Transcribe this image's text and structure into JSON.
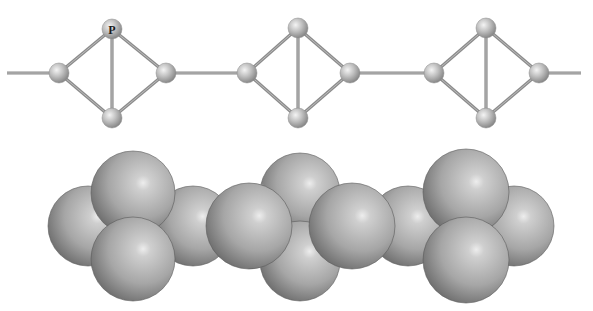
{
  "figure": {
    "atom_label": "P",
    "colors": {
      "background": "#ffffff",
      "bond": "#8c8c8c",
      "bond_highlight": "#c8c8c8",
      "atom_light": "#f2f2f2",
      "atom_mid": "#b8b8b8",
      "atom_dark": "#7a7a7a",
      "sphere_light": "#e6e6e6",
      "sphere_mid": "#a9a9a9",
      "sphere_dark": "#5e5e5e"
    }
  },
  "ball_and_stick": {
    "atom_radius": 10,
    "chain_line": {
      "x1": 7,
      "x2": 581,
      "y": 73
    },
    "units": [
      {
        "left": {
          "x": 59,
          "y": 73
        },
        "top": {
          "x": 112,
          "y": 29,
          "label": "P"
        },
        "right": {
          "x": 166,
          "y": 73
        },
        "bottom": {
          "x": 112,
          "y": 118
        }
      },
      {
        "left": {
          "x": 247,
          "y": 73
        },
        "top": {
          "x": 298,
          "y": 28
        },
        "right": {
          "x": 350,
          "y": 73
        },
        "bottom": {
          "x": 298,
          "y": 118
        }
      },
      {
        "left": {
          "x": 434,
          "y": 73
        },
        "top": {
          "x": 486,
          "y": 28
        },
        "right": {
          "x": 539,
          "y": 73
        },
        "bottom": {
          "x": 486,
          "y": 118
        }
      }
    ]
  },
  "space_filling": {
    "spheres_back_to_front": [
      {
        "x": 88,
        "y": 226,
        "r": 40
      },
      {
        "x": 193,
        "y": 226,
        "r": 40
      },
      {
        "x": 300,
        "y": 193,
        "r": 40
      },
      {
        "x": 300,
        "y": 261,
        "r": 40
      },
      {
        "x": 408,
        "y": 226,
        "r": 40
      },
      {
        "x": 514,
        "y": 226,
        "r": 40
      },
      {
        "x": 133,
        "y": 193,
        "r": 42
      },
      {
        "x": 133,
        "y": 259,
        "r": 42
      },
      {
        "x": 249,
        "y": 226,
        "r": 43
      },
      {
        "x": 352,
        "y": 226,
        "r": 43
      },
      {
        "x": 466,
        "y": 192,
        "r": 43
      },
      {
        "x": 466,
        "y": 260,
        "r": 43
      }
    ]
  }
}
